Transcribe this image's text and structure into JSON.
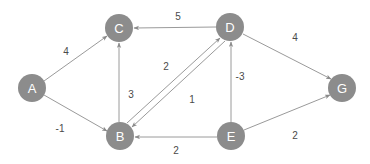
{
  "diagram": {
    "type": "directed-weighted-graph",
    "node_radius": 14,
    "node_fill": "#8c8c8c",
    "node_text_color": "#ffffff",
    "edge_color": "#9a9a9a",
    "weight_text_color": "#4a4a4a",
    "background": "#ffffff",
    "nodes": [
      {
        "id": "A",
        "label": "A",
        "x": 32,
        "y": 88
      },
      {
        "id": "B",
        "label": "B",
        "x": 120,
        "y": 136
      },
      {
        "id": "C",
        "label": "C",
        "x": 119,
        "y": 28
      },
      {
        "id": "D",
        "label": "D",
        "x": 230,
        "y": 27
      },
      {
        "id": "E",
        "label": "E",
        "x": 231,
        "y": 136
      },
      {
        "id": "G",
        "label": "G",
        "x": 342,
        "y": 88
      }
    ],
    "edges": [
      {
        "from": "A",
        "to": "C",
        "weight": "4",
        "label_x": 66,
        "label_y": 51,
        "x1": 44,
        "y1": 81,
        "x2": 107,
        "y2": 36
      },
      {
        "from": "A",
        "to": "B",
        "weight": "-1",
        "label_x": 60,
        "label_y": 128,
        "x1": 44,
        "y1": 95,
        "x2": 107,
        "y2": 131
      },
      {
        "from": "D",
        "to": "C",
        "weight": "5",
        "label_x": 178,
        "label_y": 16,
        "x1": 216,
        "y1": 27,
        "x2": 134,
        "y2": 28
      },
      {
        "from": "B",
        "to": "C",
        "weight": "3",
        "label_x": 131,
        "label_y": 94,
        "x1": 119,
        "y1": 122,
        "x2": 119,
        "y2": 43
      },
      {
        "from": "B",
        "to": "D",
        "weight": "2",
        "label_x": 166,
        "label_y": 66,
        "x1": 127,
        "y1": 123,
        "x2": 220,
        "y2": 38
      },
      {
        "from": "D",
        "to": "B",
        "weight": "1",
        "label_x": 192,
        "label_y": 99,
        "x1": 225,
        "y1": 41,
        "x2": 132,
        "y2": 127
      },
      {
        "from": "E",
        "to": "D",
        "weight": "-3",
        "label_x": 240,
        "label_y": 76,
        "x1": 231,
        "y1": 122,
        "x2": 231,
        "y2": 42
      },
      {
        "from": "E",
        "to": "B",
        "weight": "2",
        "label_x": 176,
        "label_y": 150,
        "x1": 217,
        "y1": 137,
        "x2": 135,
        "y2": 137
      },
      {
        "from": "D",
        "to": "G",
        "weight": "4",
        "label_x": 295,
        "label_y": 37,
        "x1": 243,
        "y1": 34,
        "x2": 331,
        "y2": 79
      },
      {
        "from": "E",
        "to": "G",
        "weight": "2",
        "label_x": 295,
        "label_y": 135,
        "x1": 244,
        "y1": 130,
        "x2": 330,
        "y2": 95
      }
    ]
  }
}
